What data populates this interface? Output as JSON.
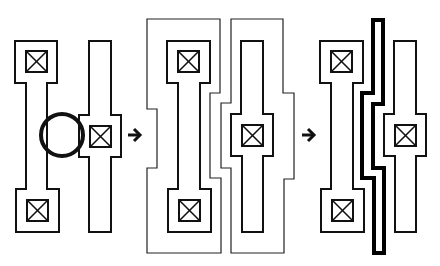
{
  "diagram": {
    "stroke_color": "#111111",
    "background": "#ffffff",
    "panels": [
      {
        "id": "before",
        "elements": [
          "left-wire-with-two-contacts",
          "right-wire-with-one-contact",
          "violation-circle"
        ]
      },
      {
        "id": "regions",
        "elements": [
          "left-wire-with-two-contacts",
          "right-wire-with-one-contact",
          "left-enclosure-region",
          "right-enclosure-region"
        ]
      },
      {
        "id": "after",
        "elements": [
          "left-wire-with-two-contacts",
          "right-wire-with-one-contact",
          "thick-separator-wire"
        ]
      }
    ],
    "arrows": [
      {
        "from": "before",
        "to": "regions",
        "glyph": "→"
      },
      {
        "from": "regions",
        "to": "after",
        "glyph": "→"
      }
    ]
  }
}
